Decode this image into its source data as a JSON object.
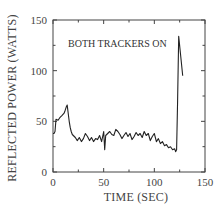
{
  "chart_data": {
    "type": "line",
    "title": "",
    "xlabel": "TIME (SEC)",
    "ylabel": "REFLECTED POWER (WATTS)",
    "xlim": [
      0,
      150
    ],
    "ylim": [
      0,
      150
    ],
    "xticks": [
      0,
      50,
      100,
      150
    ],
    "yticks": [
      0,
      50,
      100,
      150
    ],
    "minor_ticks": {
      "x": [
        25,
        75,
        125
      ],
      "y": [
        25,
        75,
        125
      ]
    },
    "grid": false,
    "legend": null,
    "annotations": [
      {
        "text": "BOTH TRACKERS ON",
        "x": 10,
        "y": 120
      }
    ],
    "series": [
      {
        "name": "Reflected power",
        "color": "#222222",
        "x": [
          0,
          1,
          2,
          3,
          5,
          7,
          9,
          11,
          12,
          13,
          14,
          15,
          16,
          17,
          18,
          19,
          20,
          22,
          24,
          26,
          28,
          30,
          32,
          34,
          36,
          38,
          40,
          42,
          44,
          46,
          48,
          50,
          51,
          52,
          54,
          56,
          58,
          60,
          62,
          64,
          66,
          68,
          70,
          72,
          74,
          76,
          78,
          80,
          82,
          84,
          86,
          88,
          90,
          92,
          94,
          96,
          98,
          100,
          102,
          104,
          106,
          108,
          110,
          112,
          114,
          116,
          118,
          120,
          121,
          122,
          123,
          124,
          128
        ],
        "y": [
          38,
          38,
          40,
          52,
          51,
          54,
          56,
          58,
          61,
          64,
          66,
          58,
          50,
          44,
          40,
          37,
          36,
          34,
          31,
          34,
          30,
          33,
          38,
          35,
          31,
          34,
          30,
          33,
          32,
          36,
          30,
          40,
          22,
          36,
          38,
          40,
          37,
          36,
          42,
          40,
          37,
          33,
          36,
          39,
          35,
          38,
          32,
          35,
          39,
          36,
          38,
          34,
          40,
          36,
          38,
          31,
          35,
          38,
          30,
          33,
          28,
          30,
          26,
          27,
          24,
          25,
          22,
          23,
          20,
          22,
          70,
          134,
          95
        ]
      }
    ]
  },
  "plot": {
    "annotation_text": "BOTH TRACKERS ON",
    "x_axis_title": "TIME (SEC)",
    "y_axis_title": "REFLECTED POWER (WATTS)",
    "x_tick_labels": [
      "0",
      "50",
      "100",
      "150"
    ],
    "y_tick_labels": [
      "0",
      "50",
      "100",
      "150"
    ]
  }
}
